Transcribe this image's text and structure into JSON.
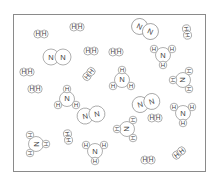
{
  "diagram": {
    "title": "",
    "frame": {
      "x": 13,
      "y": 14,
      "width": 193,
      "height": 158,
      "stroke": "#8a8a8a"
    },
    "colors": {
      "outline": "#7a7a7a",
      "text": "#444444",
      "fill": "#ffffff"
    },
    "atom_labels": {
      "nitrogen": "N",
      "hydrogen": "H"
    },
    "molecules": [
      {
        "type": "H2",
        "x": 41,
        "y": 34,
        "angle": 0
      },
      {
        "type": "H2",
        "x": 77,
        "y": 27,
        "angle": 0
      },
      {
        "type": "N2",
        "x": 57,
        "y": 57,
        "angle": 0
      },
      {
        "type": "H2",
        "x": 91,
        "y": 51,
        "angle": 0
      },
      {
        "type": "H2",
        "x": 116,
        "y": 52,
        "angle": 0
      },
      {
        "type": "N2",
        "x": 145,
        "y": 29,
        "angle": 25
      },
      {
        "type": "H2",
        "x": 187,
        "y": 32,
        "angle": 80
      },
      {
        "type": "NH3",
        "x": 163,
        "y": 55,
        "angle": 0
      },
      {
        "type": "H2",
        "x": 27,
        "y": 72,
        "angle": 0
      },
      {
        "type": "H2",
        "x": 89,
        "y": 74,
        "angle": -50
      },
      {
        "type": "NH3",
        "x": 122,
        "y": 80,
        "angle": 180
      },
      {
        "type": "NH3",
        "x": 183,
        "y": 80,
        "angle": 90
      },
      {
        "type": "H2",
        "x": 35,
        "y": 89,
        "angle": 0
      },
      {
        "type": "NH3",
        "x": 67,
        "y": 99,
        "angle": 180
      },
      {
        "type": "N2",
        "x": 146,
        "y": 103,
        "angle": -15
      },
      {
        "type": "N2",
        "x": 91,
        "y": 115,
        "angle": -10
      },
      {
        "type": "NH3",
        "x": 183,
        "y": 113,
        "angle": 0
      },
      {
        "type": "H2",
        "x": 155,
        "y": 118,
        "angle": 0
      },
      {
        "type": "NH3",
        "x": 127,
        "y": 129,
        "angle": 90
      },
      {
        "type": "NH3",
        "x": 36,
        "y": 144,
        "angle": 270
      },
      {
        "type": "H2",
        "x": 68,
        "y": 137,
        "angle": 80
      },
      {
        "type": "NH3",
        "x": 95,
        "y": 151,
        "angle": 0
      },
      {
        "type": "H2",
        "x": 148,
        "y": 160,
        "angle": 0
      },
      {
        "type": "H2",
        "x": 179,
        "y": 153,
        "angle": -40
      }
    ],
    "counts": {
      "N2": 4,
      "H2": 11,
      "NH3": 9
    }
  }
}
